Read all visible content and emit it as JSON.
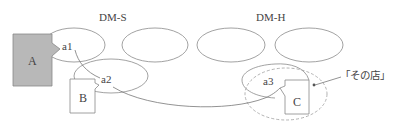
{
  "diagram": {
    "groups": [
      {
        "id": "dm-s",
        "label": "DM-S"
      },
      {
        "id": "dm-h",
        "label": "DM-H"
      }
    ],
    "entities": [
      {
        "id": "A",
        "label": "A",
        "fill": "#b8b8b8"
      },
      {
        "id": "B",
        "label": "B",
        "fill": "#ffffff"
      },
      {
        "id": "C",
        "label": "C",
        "fill": "#ffffff"
      }
    ],
    "anchors": [
      {
        "id": "a1",
        "label": "a1"
      },
      {
        "id": "a2",
        "label": "a2"
      },
      {
        "id": "a3",
        "label": "a3"
      }
    ],
    "callout": {
      "label": "「その店」"
    },
    "colors": {
      "stroke": "#777777",
      "dashed": "#999999",
      "text": "#444444",
      "a_fill": "#b8b8b8"
    }
  }
}
